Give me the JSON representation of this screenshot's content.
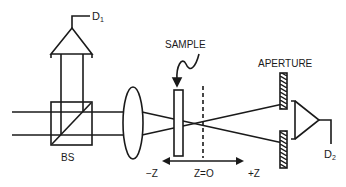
{
  "diagram": {
    "type": "optical-setup",
    "labels": {
      "detector1": "D",
      "detector1_sub": "1",
      "detector2": "D",
      "detector2_sub": "2",
      "beam_splitter": "BS",
      "sample": "SAMPLE",
      "aperture": "APERTURE",
      "minus_z": "−Z",
      "z_zero": "Z=O",
      "plus_z": "+Z"
    },
    "colors": {
      "ink": "#1a1a1a",
      "background": "#ffffff"
    }
  }
}
